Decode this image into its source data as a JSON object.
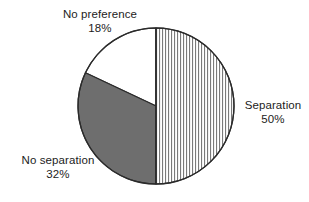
{
  "chart_data": {
    "type": "pie",
    "title": "",
    "subtitle": "",
    "xlabel": "",
    "ylabel": "",
    "legend_position": "none",
    "grid": false,
    "start_angle_deg": 0,
    "direction": "clockwise",
    "units": "percent",
    "total": 100,
    "categories": [
      "Separation",
      "No separation",
      "No preference"
    ],
    "values": [
      50,
      32,
      18
    ],
    "slices": [
      {
        "label": "Separation",
        "value": 50,
        "value_text": "50%",
        "fill": "vertical-hatch",
        "fill_color": "#ffffff",
        "hatch_color": "#7a7a7a",
        "start_deg": 0,
        "end_deg": 180
      },
      {
        "label": "No separation",
        "value": 32,
        "value_text": "32%",
        "fill": "solid",
        "fill_color": "#6e6e6e",
        "hatch_color": "",
        "start_deg": 180,
        "end_deg": 295.2
      },
      {
        "label": "No preference",
        "value": 18,
        "value_text": "18%",
        "fill": "solid",
        "fill_color": "#ffffff",
        "hatch_color": "",
        "start_deg": 295.2,
        "end_deg": 360
      }
    ]
  },
  "labels": {
    "no_preference": {
      "name": "No preference",
      "value": "18%"
    },
    "no_separation": {
      "name": "No separation",
      "value": "32%"
    },
    "separation": {
      "name": "Separation",
      "value": "50%"
    }
  },
  "style": {
    "background": "#ffffff",
    "outline_color": "#2b2b2b",
    "text_color": "#1c1c1c",
    "gray_slice": "#6e6e6e",
    "hatch_line": "#7a7a7a"
  }
}
